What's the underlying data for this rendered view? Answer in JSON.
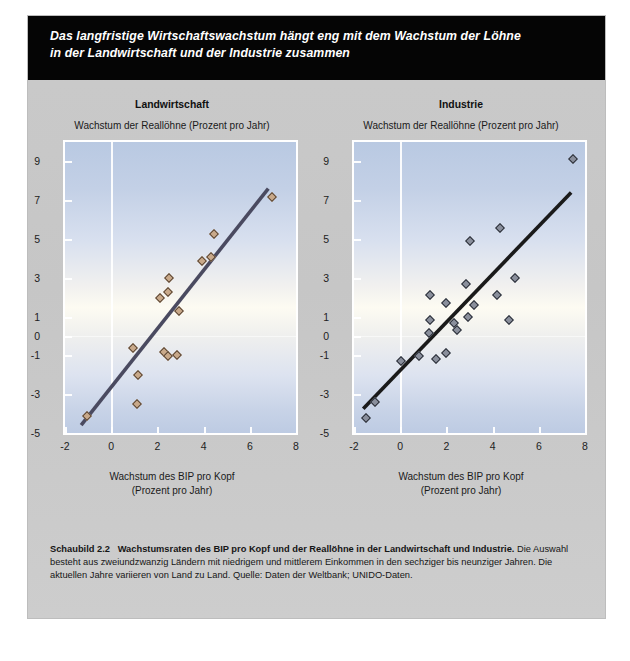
{
  "headline": {
    "line1": "Das langfristige Wirtschaftswachstum hängt eng mit dem Wachstum der Löhne",
    "line2": "in der Landwirtschaft und der Industrie zusammen"
  },
  "caption": {
    "figure_number": "Schaubild 2.2",
    "bold_title": "Wachstumsraten des BIP pro Kopf und der Reallöhne in der Landwirtschaft und Industrie.",
    "body": "Die Auswahl besteht aus zweiundzwanzig Ländern mit niedrigem und mittlerem Einkommen in den sechziger bis neunziger Jahren. Die aktuellen Jahre variieren von Land zu Land. Quelle: Daten der Weltbank; UNIDO-Daten."
  },
  "colors": {
    "panel_background": "#c9c9c9",
    "headline_background": "#050505",
    "headline_text": "#ffffff",
    "plot_top": "#b9c9e2",
    "plot_middle": "#fdfbf2",
    "agriculture_marker_fill": "#c9a98a",
    "agriculture_marker_edge": "#5a4533",
    "industry_marker_fill": "#8a8f9c",
    "industry_marker_edge": "#2b2f38",
    "trendline_left": "#4a4a60",
    "trendline_right": "#1a1a1a"
  },
  "chart_data": [
    {
      "type": "scatter",
      "id": "landwirtschaft",
      "title": "Landwirtschaft",
      "ylabel": "Wachstum der Reallöhne (Prozent pro Jahr)",
      "xlabel_line1": "Wachstum des BIP pro Kopf",
      "xlabel_line2": "(Prozent pro Jahr)",
      "xlim": [
        -2,
        8
      ],
      "ylim": [
        -5,
        10
      ],
      "xticks": [
        -2,
        0,
        2,
        4,
        6,
        8
      ],
      "xtick_labels": [
        "-2",
        "0",
        "2",
        "4",
        "6",
        "8"
      ],
      "yticks": [
        9,
        7,
        5,
        3,
        1,
        0,
        -1,
        -3,
        -5
      ],
      "ytick_labels": [
        "9",
        "7",
        "5",
        "3",
        "1",
        "0",
        "-1",
        "-3",
        "-5"
      ],
      "grid": "vertical-at-zero",
      "legend": "none",
      "points": [
        {
          "x": -1.05,
          "y": -4.1
        },
        {
          "x": 1.1,
          "y": -3.5
        },
        {
          "x": 1.15,
          "y": -2.0
        },
        {
          "x": 0.95,
          "y": -0.6
        },
        {
          "x": 2.3,
          "y": -0.85
        },
        {
          "x": 2.45,
          "y": -1.05
        },
        {
          "x": 2.85,
          "y": -1.0
        },
        {
          "x": 2.1,
          "y": 1.95
        },
        {
          "x": 2.45,
          "y": 2.25
        },
        {
          "x": 2.5,
          "y": 3.0
        },
        {
          "x": 2.95,
          "y": 1.3
        },
        {
          "x": 3.95,
          "y": 3.85
        },
        {
          "x": 4.3,
          "y": 4.05
        },
        {
          "x": 4.45,
          "y": 5.25
        },
        {
          "x": 6.95,
          "y": 7.15
        }
      ],
      "trendline": {
        "x0": -1.3,
        "y0": -4.6,
        "x1": 6.8,
        "y1": 7.6
      }
    },
    {
      "type": "scatter",
      "id": "industrie",
      "title": "Industrie",
      "ylabel": "Wachstum der Reallöhne (Prozent pro Jahr)",
      "xlabel_line1": "Wachstum des BIP pro Kopf",
      "xlabel_line2": "(Prozent pro Jahr)",
      "xlim": [
        -2,
        8
      ],
      "ylim": [
        -5,
        10
      ],
      "xticks": [
        -2,
        0,
        2,
        4,
        6,
        8
      ],
      "xtick_labels": [
        "-2",
        "0",
        "2",
        "4",
        "6",
        "8"
      ],
      "yticks": [
        9,
        7,
        5,
        3,
        1,
        0,
        -1,
        -3,
        -5
      ],
      "ytick_labels": [
        "9",
        "7",
        "5",
        "3",
        "1",
        "0",
        "-1",
        "-3",
        "-5"
      ],
      "grid": "vertical-at-zero",
      "legend": "none",
      "points": [
        {
          "x": -1.5,
          "y": -4.25
        },
        {
          "x": -1.1,
          "y": -3.4
        },
        {
          "x": 0.05,
          "y": -1.3
        },
        {
          "x": 0.8,
          "y": -1.05
        },
        {
          "x": 1.55,
          "y": -1.2
        },
        {
          "x": 2.0,
          "y": -0.9
        },
        {
          "x": 1.25,
          "y": 0.15
        },
        {
          "x": 2.45,
          "y": 0.3
        },
        {
          "x": 2.35,
          "y": 0.65
        },
        {
          "x": 1.3,
          "y": 0.85
        },
        {
          "x": 2.95,
          "y": 1.0
        },
        {
          "x": 4.7,
          "y": 0.85
        },
        {
          "x": 2.0,
          "y": 1.7
        },
        {
          "x": 3.2,
          "y": 1.6
        },
        {
          "x": 1.3,
          "y": 2.1
        },
        {
          "x": 4.2,
          "y": 2.1
        },
        {
          "x": 2.85,
          "y": 2.7
        },
        {
          "x": 4.95,
          "y": 3.0
        },
        {
          "x": 3.0,
          "y": 4.9
        },
        {
          "x": 4.3,
          "y": 5.55
        },
        {
          "x": 7.5,
          "y": 9.1
        }
      ],
      "trendline": {
        "x0": -1.6,
        "y0": -3.75,
        "x1": 7.4,
        "y1": 7.4
      }
    }
  ]
}
